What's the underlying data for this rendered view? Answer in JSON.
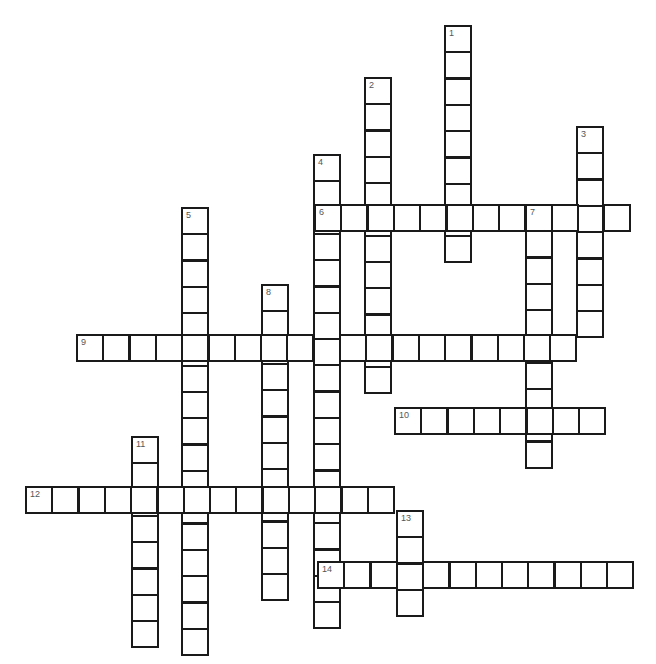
{
  "puzzle": {
    "type": "crossword",
    "cell_size": 26.3,
    "border_color": "#1a1a1a",
    "number_color": "#555555",
    "words": [
      {
        "number": "1",
        "direction": "down",
        "x": 444,
        "y": 25,
        "length": 9
      },
      {
        "number": "2",
        "direction": "down",
        "x": 364,
        "y": 77,
        "length": 12
      },
      {
        "number": "3",
        "direction": "down",
        "x": 576,
        "y": 126,
        "length": 8
      },
      {
        "number": "4",
        "direction": "down",
        "x": 313,
        "y": 154,
        "length": 18
      },
      {
        "number": "5",
        "direction": "down",
        "x": 181,
        "y": 207,
        "length": 17
      },
      {
        "number": "6",
        "direction": "across",
        "x": 314,
        "y": 204,
        "length": 12
      },
      {
        "number": "7",
        "direction": "down",
        "x": 525,
        "y": 204,
        "length": 10
      },
      {
        "number": "8",
        "direction": "down",
        "x": 261,
        "y": 284,
        "length": 12
      },
      {
        "number": "9",
        "direction": "across",
        "x": 76,
        "y": 334,
        "length": 19
      },
      {
        "number": "10",
        "direction": "across",
        "x": 394,
        "y": 407,
        "length": 8
      },
      {
        "number": "11",
        "direction": "down",
        "x": 131,
        "y": 436,
        "length": 8
      },
      {
        "number": "12",
        "direction": "across",
        "x": 25,
        "y": 486,
        "length": 14
      },
      {
        "number": "13",
        "direction": "down",
        "x": 396,
        "y": 510,
        "length": 4
      },
      {
        "number": "14",
        "direction": "across",
        "x": 317,
        "y": 561,
        "length": 12
      }
    ]
  }
}
